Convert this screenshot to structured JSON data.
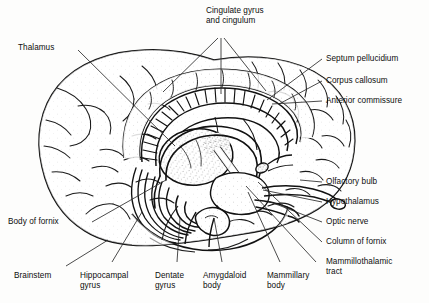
{
  "figure": {
    "kind": "anatomical-illustration",
    "ink_color": "#111111",
    "background_color": "#fdfdfc"
  },
  "labels": {
    "cingulate": "Cingulate gyrus\nand cingulum",
    "thalamus": "Thalamus",
    "septum_pellucidium": "Septum pellucidium",
    "corpus_callosum": "Corpus callosum",
    "anterior_commissure": "Anterior commissure",
    "olfactory_bulb": "Olfactory bulb",
    "hypothalamus": "Hypothalamus",
    "optic_nerve": "Optic nerve",
    "column_of_fornix": "Column of fornix",
    "mammillothalamic_tract": "Mammillothalamic\ntract",
    "body_of_fornix": "Body of fornix",
    "brainstem": "Brainstem",
    "hippocampal_gyrus": "Hippocampal\ngyrus",
    "dentate_gyrus": "Dentate\ngyrus",
    "amygdaloid_body": "Amygdaloid\nbody",
    "mammillary_body": "Mammillary\nbody"
  }
}
